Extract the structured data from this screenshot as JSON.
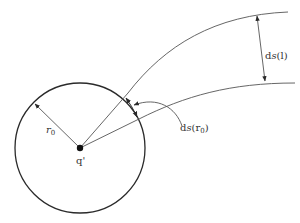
{
  "diagram": {
    "type": "field-line geometry",
    "colors": {
      "stroke": "#2a2a2a",
      "thin_stroke": "#555555",
      "text": "#333333",
      "background": "#ffffff"
    },
    "labels": {
      "charge": "q'",
      "radius_prefix": "r",
      "radius_sub": "0",
      "ds_l_prefix": "d",
      "ds_l_s": "s",
      "ds_l_arg": "(l)",
      "ds_r0_prefix": "d",
      "ds_r0_s": "s",
      "ds_r0_open": "(r",
      "ds_r0_sub": "0",
      "ds_r0_close": ")"
    },
    "elements": [
      {
        "id": "circle",
        "kind": "circle",
        "label": "sphere of radius r0 around q'"
      },
      {
        "id": "charge",
        "kind": "point",
        "label": "q'"
      },
      {
        "id": "radius-arrow",
        "kind": "arrow",
        "label": "r0"
      },
      {
        "id": "field-line-upper",
        "kind": "curve"
      },
      {
        "id": "field-line-lower",
        "kind": "curve"
      },
      {
        "id": "ds-l-arrow",
        "kind": "double-arrow",
        "label": "ds(l)"
      },
      {
        "id": "ds-r0-arrow",
        "kind": "double-arrow",
        "label": "ds(r0)"
      },
      {
        "id": "ds-r0-pointer",
        "kind": "curved-arrow"
      }
    ]
  }
}
